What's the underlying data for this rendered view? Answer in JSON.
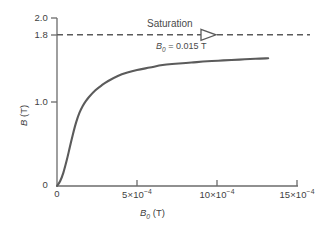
{
  "chart_data": {
    "type": "line",
    "title": "",
    "xlabel": "B0 (T)",
    "ylabel": "B (T)",
    "xlim": [
      0,
      0.0015
    ],
    "ylim": [
      0,
      2.0
    ],
    "grid": false,
    "legend": null,
    "x_ticks": [
      {
        "value": 0,
        "label": "0"
      },
      {
        "value": 0.0005,
        "mantissa": "5",
        "times": "×",
        "base": "10",
        "exponent": "−4"
      },
      {
        "value": 0.001,
        "mantissa": "10",
        "times": "×",
        "base": "10",
        "exponent": "−4"
      },
      {
        "value": 0.0015,
        "mantissa": "15",
        "times": "×",
        "base": "10",
        "exponent": "−4"
      }
    ],
    "y_ticks": [
      {
        "value": 0,
        "label": "0"
      },
      {
        "value": 1.0,
        "label": "1.0"
      },
      {
        "value": 1.8,
        "label": "1.8"
      },
      {
        "value": 2.0,
        "label": "2.0"
      }
    ],
    "series": [
      {
        "name": "Magnetization curve",
        "color": "#5b5b5b",
        "x": [
          0.0,
          2e-05,
          4e-05,
          6e-05,
          8e-05,
          0.0001,
          0.00012,
          0.00014,
          0.00016,
          0.00018,
          0.0002,
          0.00024,
          0.00028,
          0.00032,
          0.00038,
          0.00044,
          0.0005,
          0.00058,
          0.00066,
          0.00074,
          0.00084,
          0.00094,
          0.00104,
          0.00114,
          0.00124,
          0.00132
        ],
        "y": [
          0.0,
          0.06,
          0.16,
          0.3,
          0.46,
          0.62,
          0.76,
          0.87,
          0.95,
          1.01,
          1.06,
          1.14,
          1.2,
          1.25,
          1.31,
          1.35,
          1.38,
          1.41,
          1.44,
          1.455,
          1.47,
          1.485,
          1.495,
          1.505,
          1.515,
          1.52
        ]
      }
    ],
    "annotations": {
      "saturation_line": {
        "label": "Saturation",
        "y_value": 1.8,
        "style": "dashed",
        "color": "#5b5b5b",
        "arrow": "right-open-triangle"
      },
      "applied_field": {
        "symbol": "B",
        "subscript": "0",
        "equals": " = ",
        "value": "0.015",
        "unit": "T",
        "full_text": "B0 = 0.015 T"
      }
    }
  },
  "axis_titles": {
    "x": {
      "symbol": "B",
      "subscript": "0",
      "unit": "(T)"
    },
    "y": {
      "symbol": "B",
      "unit": "(T)"
    }
  },
  "colors": {
    "curve": "#5b5b5b",
    "axis": "#6b6b6b",
    "text": "#3f3f3f",
    "dashed": "#5b5b5b",
    "background": "#ffffff"
  }
}
